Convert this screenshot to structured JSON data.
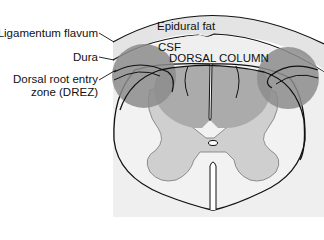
{
  "diagram": {
    "labels": {
      "ligamentum_flavum": "Ligamentum flavum",
      "dura": "Dura",
      "drez_line1": "Dorsal root entry",
      "drez_line2": "zone (DREZ)",
      "epidural_fat": "Epidural fat",
      "csf": "CSF",
      "dorsal_column": "DORSAL COLUMN"
    },
    "colors": {
      "background": "#ffffff",
      "epidural_band": "#e6e6e6",
      "csf_region": "#ececec",
      "white_matter": "#f0f0f0",
      "gray_matter": "#c9c9c9",
      "dorsal_column": "#a8a8a8",
      "drez_circle": "#8a8a8a",
      "outline": "#111111"
    }
  }
}
